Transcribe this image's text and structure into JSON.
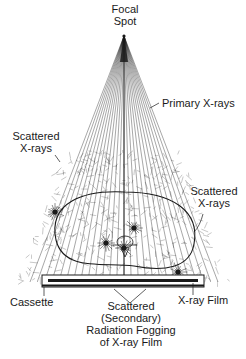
{
  "diagram": {
    "labels": {
      "focal_spot": [
        "Focal",
        "Spot"
      ],
      "primary_xrays": "Primary X-rays",
      "scattered_left": [
        "Scattered",
        "X-rays"
      ],
      "scattered_right": [
        "Scattered",
        "X-rays"
      ],
      "cassette": "Cassette",
      "xray_film": "X-ray Film",
      "fogging": [
        "Scattered",
        "(Secondary)",
        "Radiation Fogging",
        "of X-ray Film"
      ]
    },
    "geometry": {
      "focal_point": [
        124,
        36
      ],
      "beam_bottom_y": 282,
      "beam_left_x": 30,
      "beam_right_x": 218,
      "primary_ray_count": 27,
      "body_center": [
        124,
        232
      ],
      "body_rx": 70,
      "body_ry": 38,
      "cassette": {
        "x": 42,
        "y": 275,
        "w": 162,
        "h": 12
      },
      "film": {
        "x": 48,
        "y": 279,
        "w": 150,
        "h": 3
      },
      "scatter_points": [
        [
          55,
          212
        ],
        [
          106,
          243
        ],
        [
          134,
          228
        ],
        [
          124,
          248
        ],
        [
          178,
          272
        ]
      ]
    },
    "colors": {
      "ink": "#1a1a1a",
      "paper": "#ffffff"
    }
  }
}
